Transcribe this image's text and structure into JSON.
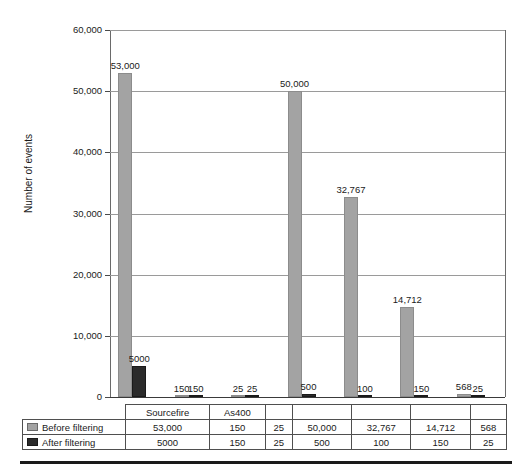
{
  "chart_data": {
    "type": "bar",
    "title": "",
    "subtitle": "",
    "xlabel": "",
    "ylabel": "Number of events",
    "ylim": [
      0,
      60000
    ],
    "ytick_values": [
      0,
      10000,
      20000,
      30000,
      40000,
      50000,
      60000
    ],
    "ytick_labels": [
      "0",
      "10,000",
      "20,000",
      "30,000",
      "40,000",
      "50,000",
      "60,000"
    ],
    "grid": true,
    "legend_position": "table-row-headers",
    "categories": [
      "Sourcefire",
      "As400",
      "",
      "",
      "",
      "",
      ""
    ],
    "series": [
      {
        "name": "Before filtering",
        "color": "#a3a3a3",
        "values": [
          53000,
          150,
          25,
          50000,
          32767,
          14712,
          568
        ],
        "labels": [
          "53,000",
          "150",
          "25",
          "50,000",
          "32,767",
          "14,712",
          "568"
        ]
      },
      {
        "name": "After filtering",
        "color": "#2b2b2b",
        "values": [
          5000,
          150,
          25,
          500,
          100,
          150,
          25
        ],
        "labels": [
          "5000",
          "150",
          "25",
          "500",
          "100",
          "150",
          "25"
        ]
      }
    ],
    "annotations": [
      "Labels for group 2 overlap and read as 15,050",
      "Labels for group 3 overlap and read as 2525"
    ]
  },
  "table": {
    "row_header_label": "",
    "column_headers": [
      "Sourcefire",
      "As400",
      "",
      "",
      "",
      "",
      ""
    ],
    "rows": [
      {
        "label": "Before filtering",
        "marker": "legend-swatch-before",
        "values": [
          "53,000",
          "150",
          "25",
          "50,000",
          "32,767",
          "14,712",
          "568"
        ]
      },
      {
        "label": "After filtering",
        "marker": "legend-swatch-after",
        "values": [
          "5000",
          "150",
          "25",
          "500",
          "100",
          "150",
          "25"
        ]
      }
    ]
  }
}
